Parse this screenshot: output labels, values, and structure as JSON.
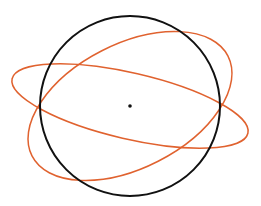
{
  "diagram": {
    "background": "#ffffff",
    "circle": {
      "cx": 130,
      "cy": 106,
      "r": 90,
      "stroke": "#111111",
      "stroke_width": 2
    },
    "center_point": {
      "cx": 130,
      "cy": 106,
      "r": 1.8,
      "fill": "#111111"
    },
    "ellipses": [
      {
        "name": "flat-ellipse",
        "cx": 130,
        "cy": 106,
        "rx": 121,
        "ry": 33,
        "rotation": 13,
        "stroke": "#e0622f",
        "stroke_width": 1.5
      },
      {
        "name": "tilted-ellipse",
        "cx": 130,
        "cy": 106,
        "rx": 110,
        "ry": 62,
        "rotation": -27,
        "stroke": "#e0622f",
        "stroke_width": 1.5
      }
    ]
  }
}
